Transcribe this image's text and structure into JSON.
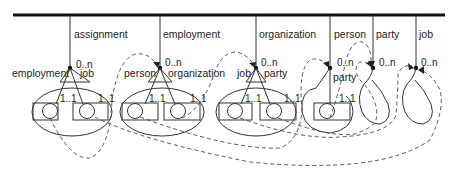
{
  "diagram": {
    "columns": [
      {
        "id": "assignment",
        "label": "assignment",
        "multiplicity": "0..n",
        "roles": [
          "employment",
          "job"
        ],
        "role_cards": [
          "1..1",
          "1..1"
        ]
      },
      {
        "id": "employment",
        "label": "employment",
        "multiplicity": "0..n",
        "roles": [
          "person",
          "organization"
        ],
        "role_cards": [
          "1..1",
          "1..1"
        ]
      },
      {
        "id": "organization",
        "label": "organization",
        "multiplicity": "0..n",
        "roles": [
          "job",
          "party"
        ],
        "role_cards": [
          "1..1",
          "1..1"
        ]
      },
      {
        "id": "person",
        "label": "person",
        "multiplicity": "0..n",
        "roles": [
          "party"
        ],
        "role_cards": [
          "1..1"
        ]
      },
      {
        "id": "party",
        "label": "party",
        "multiplicity": "0..n",
        "roles": [],
        "role_cards": []
      },
      {
        "id": "job",
        "label": "job",
        "multiplicity": "0..n",
        "roles": [],
        "role_cards": []
      }
    ],
    "references": [
      {
        "from": "assignment.employment",
        "to": "employment"
      },
      {
        "from": "assignment.job",
        "to": "job"
      },
      {
        "from": "employment.person",
        "to": "person"
      },
      {
        "from": "employment.organization",
        "to": "organization"
      },
      {
        "from": "organization.job",
        "to": "job"
      },
      {
        "from": "organization.party",
        "to": "party"
      },
      {
        "from": "person.party",
        "to": "party"
      }
    ]
  }
}
